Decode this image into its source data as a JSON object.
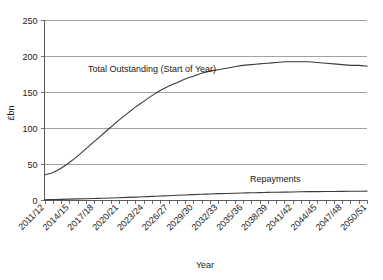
{
  "chart_data": {
    "type": "line",
    "title": "",
    "xlabel": "Year",
    "ylabel": "£bn",
    "ylim": [
      0,
      250
    ],
    "yticks": [
      0,
      50,
      100,
      150,
      200,
      250
    ],
    "grid": true,
    "legend_position": "inline-annotations",
    "categories": [
      "2011/12",
      "2012/13",
      "2013/14",
      "2014/15",
      "2015/16",
      "2016/17",
      "2017/18",
      "2018/19",
      "2019/20",
      "2020/21",
      "2021/22",
      "2022/23",
      "2023/24",
      "2024/25",
      "2025/26",
      "2026/27",
      "2027/28",
      "2028/29",
      "2029/30",
      "2030/31",
      "2031/32",
      "2032/33",
      "2033/34",
      "2034/35",
      "2035/36",
      "2036/37",
      "2037/38",
      "2038/39",
      "2039/40",
      "2040/41",
      "2041/42",
      "2042/43",
      "2043/44",
      "2044/45",
      "2045/46",
      "2046/47",
      "2047/48",
      "2048/49",
      "2049/50",
      "2050/51"
    ],
    "xtick_labels": [
      "2011/12",
      "2014/15",
      "2017/18",
      "2020/21",
      "2023/24",
      "2026/27",
      "2029/30",
      "2032/33",
      "2035/36",
      "2038/39",
      "2041/42",
      "2044/45",
      "2047/48",
      "2050/51"
    ],
    "series": [
      {
        "name": "Total Outstanding (Start of Year)",
        "annotation": "Total Outstanding (Start of Year)",
        "color": "#3a3a3a",
        "values": [
          35,
          38,
          44,
          52,
          61,
          71,
          81,
          91,
          101,
          111,
          120,
          129,
          137,
          145,
          152,
          158,
          163,
          168,
          172,
          176,
          179,
          181,
          183,
          185,
          187,
          188,
          189,
          190,
          191,
          192,
          192,
          192,
          192,
          191,
          190,
          189,
          188,
          187,
          187,
          186
        ]
      },
      {
        "name": "Repayments",
        "annotation": "Repayments",
        "color": "#3a3a3a",
        "values": [
          0.4,
          0.6,
          0.9,
          1.2,
          1.5,
          1.8,
          2.1,
          2.4,
          2.8,
          3.2,
          3.6,
          4.0,
          4.5,
          5.0,
          5.5,
          6.0,
          6.5,
          7.0,
          7.5,
          8.0,
          8.4,
          8.8,
          9.1,
          9.4,
          9.7,
          10.0,
          10.3,
          10.6,
          10.8,
          11.0,
          11.2,
          11.4,
          11.6,
          11.7,
          11.8,
          11.9,
          12.0,
          12.1,
          12.2,
          12.3
        ]
      }
    ]
  }
}
